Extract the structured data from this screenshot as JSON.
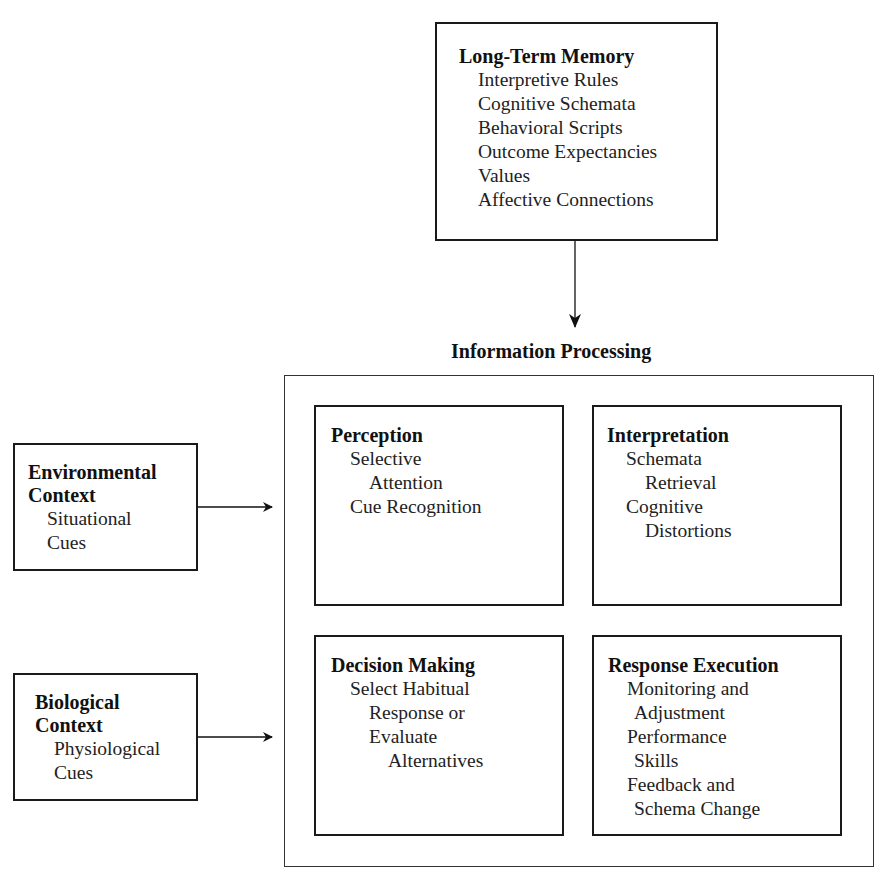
{
  "long_term_memory": {
    "title": "Long-Term Memory",
    "items": [
      "Interpretive Rules",
      "Cognitive Schemata",
      "Behavioral Scripts",
      "Outcome Expectancies",
      "Values",
      "Affective Connections"
    ]
  },
  "information_processing": {
    "title": "Information Processing",
    "perception": {
      "title": "Perception",
      "lines": [
        "Selective",
        "Attention",
        "Cue Recognition"
      ]
    },
    "interpretation": {
      "title": "Interpretation",
      "lines": [
        "Schemata",
        "Retrieval",
        "Cognitive",
        "Distortions"
      ]
    },
    "decision_making": {
      "title": "Decision Making",
      "lines": [
        "Select Habitual",
        "Response or",
        "Evaluate",
        "Alternatives"
      ]
    },
    "response_execution": {
      "title": "Response Execution",
      "lines": [
        "Monitoring and",
        "Adjustment",
        "Performance",
        "Skills",
        "Feedback and",
        "Schema Change"
      ]
    }
  },
  "environmental_context": {
    "title_line1": "Environmental",
    "title_line2": "Context",
    "lines": [
      "Situational",
      "Cues"
    ]
  },
  "biological_context": {
    "title_line1": "Biological",
    "title_line2": "Context",
    "lines": [
      "Physiological",
      "Cues"
    ]
  }
}
